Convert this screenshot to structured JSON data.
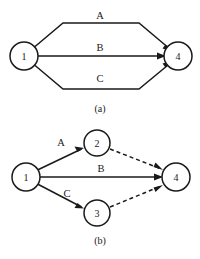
{
  "figure": {
    "background_color": "#ffffff",
    "ink_color": "#1a1a1a",
    "width": 200,
    "height": 259
  },
  "panels": [
    {
      "id": "panel-a",
      "caption": "(a)",
      "nodes": [
        {
          "id": "a-node-1",
          "label": "1",
          "cx": 24,
          "cy": 56,
          "r": 14
        },
        {
          "id": "a-node-4",
          "label": "4",
          "cx": 178,
          "cy": 56,
          "r": 14
        }
      ],
      "edges": [
        {
          "id": "a-edge-A",
          "label": "A",
          "from": "1",
          "to": "4",
          "style": "solid",
          "label_x": 100,
          "label_y": 15
        },
        {
          "id": "a-edge-B",
          "label": "B",
          "from": "1",
          "to": "4",
          "style": "solid",
          "label_x": 100,
          "label_y": 47
        },
        {
          "id": "a-edge-C",
          "label": "C",
          "from": "1",
          "to": "4",
          "style": "solid",
          "label_x": 100,
          "label_y": 78
        }
      ]
    },
    {
      "id": "panel-b",
      "caption": "(b)",
      "nodes": [
        {
          "id": "b-node-1",
          "label": "1",
          "cx": 26,
          "cy": 177,
          "r": 14
        },
        {
          "id": "b-node-2",
          "label": "2",
          "cx": 97,
          "cy": 143,
          "r": 13
        },
        {
          "id": "b-node-3",
          "label": "3",
          "cx": 97,
          "cy": 213,
          "r": 13
        },
        {
          "id": "b-node-4",
          "label": "4",
          "cx": 176,
          "cy": 177,
          "r": 14
        }
      ],
      "edges": [
        {
          "id": "b-edge-A",
          "label": "A",
          "from": "1",
          "to": "2",
          "style": "solid",
          "label_x": 61,
          "label_y": 142
        },
        {
          "id": "b-edge-B",
          "label": "B",
          "from": "1",
          "to": "4",
          "style": "solid",
          "label_x": 101,
          "label_y": 168
        },
        {
          "id": "b-edge-C",
          "label": "C",
          "from": "1",
          "to": "3",
          "style": "solid",
          "label_x": 67,
          "label_y": 193
        },
        {
          "id": "b-edge-2-4",
          "label": "",
          "from": "2",
          "to": "4",
          "style": "dashed",
          "label_x": 0,
          "label_y": 0
        },
        {
          "id": "b-edge-3-4",
          "label": "",
          "from": "3",
          "to": "4",
          "style": "dashed",
          "label_x": 0,
          "label_y": 0
        }
      ]
    }
  ]
}
